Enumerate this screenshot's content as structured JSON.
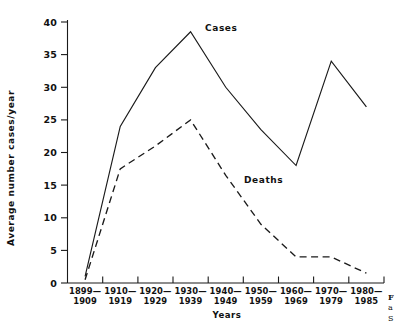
{
  "chart_data": {
    "type": "line",
    "title": "",
    "xlabel": "Years",
    "ylabel": "Average number cases/year",
    "categories": [
      "1899-\n1909",
      "1910-\n1919",
      "1920-\n1929",
      "1930-\n1939",
      "1940-\n1949",
      "1950-\n1959",
      "1960-\n1969",
      "1970-\n1979",
      "1980-\n1985"
    ],
    "category_lines": [
      [
        "1899—",
        "1909"
      ],
      [
        "1910—",
        "1919"
      ],
      [
        "1920—",
        "1929"
      ],
      [
        "1930—",
        "1939"
      ],
      [
        "1940—",
        "1949"
      ],
      [
        "1950—",
        "1959"
      ],
      [
        "1960—",
        "1969"
      ],
      [
        "1970—",
        "1979"
      ],
      [
        "1980—",
        "1985"
      ]
    ],
    "series": [
      {
        "name": "Cases",
        "style": "solid",
        "values": [
          1,
          24,
          33,
          38.5,
          30,
          23.5,
          18,
          34,
          27
        ]
      },
      {
        "name": "Deaths",
        "style": "dashed",
        "values": [
          0.5,
          17.5,
          21,
          25,
          16.5,
          9,
          4,
          4,
          1.5
        ]
      }
    ],
    "ylim": [
      0,
      40
    ],
    "yticks": [
      0,
      5,
      10,
      15,
      20,
      25,
      30,
      35,
      40
    ],
    "ytick_labels": [
      "0",
      "5",
      "10",
      "15",
      "20",
      "25",
      "30",
      "35",
      "40"
    ],
    "grid": false,
    "legend": "inline-annotations",
    "annotations": [
      {
        "text": "Cases",
        "series": "Cases",
        "x_px": 205,
        "y_px": 31
      },
      {
        "text": "Deaths",
        "series": "Deaths",
        "x_px": 244,
        "y_px": 183
      }
    ]
  },
  "caption": {
    "line1": "F",
    "line2": "a",
    "line3": "S"
  }
}
